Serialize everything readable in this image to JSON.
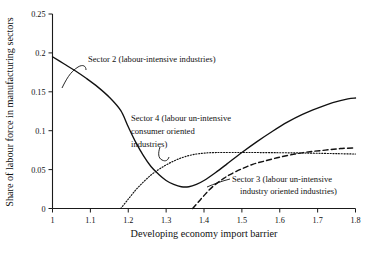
{
  "chart_data": {
    "type": "line",
    "title": "",
    "xlabel": "Developing economy import barrier",
    "ylabel": "Share of labour force in manufacturing sectors",
    "xlim": [
      1,
      1.8
    ],
    "ylim": [
      0,
      0.25
    ],
    "grid": false,
    "legend_position": "inline-annotations",
    "xticks": [
      "1",
      "1.1",
      "1.2",
      "1.3",
      "1.4",
      "1.5",
      "1.6",
      "1.7",
      "1.8"
    ],
    "xtick_values": [
      1,
      1.1,
      1.2,
      1.3,
      1.4,
      1.5,
      1.6,
      1.7,
      1.8
    ],
    "yticks": [
      "0",
      "0.05",
      "0.1",
      "0.15",
      "0.2",
      "0.25"
    ],
    "ytick_values": [
      0,
      0.05,
      0.1,
      0.15,
      0.2,
      0.25
    ],
    "series": [
      {
        "name": "Sector 2 (labour-intensive industries)",
        "style": "solid",
        "x": [
          1.0,
          1.03,
          1.06,
          1.09,
          1.12,
          1.15,
          1.18,
          1.2,
          1.22,
          1.24,
          1.26,
          1.28,
          1.3,
          1.32,
          1.34,
          1.36,
          1.38,
          1.4,
          1.43,
          1.46,
          1.5,
          1.54,
          1.58,
          1.62,
          1.66,
          1.7,
          1.74,
          1.78,
          1.8
        ],
        "y": [
          0.195,
          0.186,
          0.177,
          0.167,
          0.156,
          0.143,
          0.126,
          0.105,
          0.085,
          0.068,
          0.054,
          0.044,
          0.036,
          0.031,
          0.028,
          0.028,
          0.031,
          0.036,
          0.046,
          0.057,
          0.072,
          0.086,
          0.099,
          0.111,
          0.121,
          0.129,
          0.136,
          0.141,
          0.142
        ]
      },
      {
        "name": "Sector 4 (labour un-intensive consumer oriented industries)",
        "style": "dotted",
        "x": [
          1.18,
          1.2,
          1.22,
          1.24,
          1.26,
          1.28,
          1.3,
          1.32,
          1.34,
          1.36,
          1.38,
          1.4,
          1.42,
          1.45,
          1.5,
          1.55,
          1.6,
          1.65,
          1.7,
          1.75,
          1.8
        ],
        "y": [
          0.0,
          0.012,
          0.024,
          0.034,
          0.043,
          0.05,
          0.056,
          0.061,
          0.065,
          0.068,
          0.07,
          0.0712,
          0.0718,
          0.072,
          0.072,
          0.0719,
          0.0717,
          0.0714,
          0.071,
          0.0705,
          0.07
        ]
      },
      {
        "name": "Sector 3 (labour un-intensive industry oriented industries)",
        "style": "dashed",
        "x": [
          1.37,
          1.39,
          1.41,
          1.43,
          1.45,
          1.47,
          1.5,
          1.53,
          1.56,
          1.6,
          1.64,
          1.68,
          1.72,
          1.76,
          1.8
        ],
        "y": [
          0.0,
          0.011,
          0.022,
          0.031,
          0.038,
          0.044,
          0.051,
          0.057,
          0.061,
          0.066,
          0.07,
          0.073,
          0.075,
          0.077,
          0.078
        ]
      }
    ],
    "annotations": [
      {
        "id": "sector2",
        "lines": [
          "Sector 2 (labour-intensive industries)"
        ]
      },
      {
        "id": "sector4",
        "lines": [
          "Sector 4 (labour un-intensive",
          "consumer oriented",
          "industries)"
        ]
      },
      {
        "id": "sector3",
        "lines": [
          "Sector 3 (labour un-intensive",
          "industry oriented industries)"
        ]
      }
    ]
  }
}
